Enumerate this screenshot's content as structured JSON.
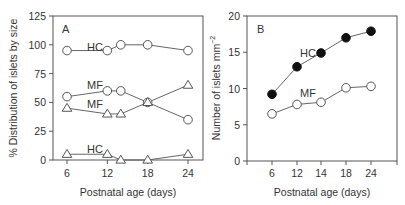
{
  "chart_data": [
    {
      "panel": "A",
      "type": "line",
      "title": "",
      "panel_label": "A",
      "xlabel": "Postnatal age (days)",
      "ylabel": "% Distribution of islets by size",
      "x": [
        6,
        12,
        14,
        18,
        24
      ],
      "xticks": [
        6,
        12,
        18,
        24
      ],
      "yticks": [
        0,
        25,
        50,
        75,
        100,
        125
      ],
      "ylim": [
        0,
        125
      ],
      "xlim": [
        4,
        26
      ],
      "grid": false,
      "series": [
        {
          "name": "HC",
          "group": "circle",
          "marker": "open-circle",
          "values": [
            95,
            95,
            100,
            100,
            95
          ],
          "label_pos": {
            "x": 12,
            "y": 100
          }
        },
        {
          "name": "MF",
          "group": "circle",
          "marker": "open-circle",
          "values": [
            55,
            60,
            60,
            50,
            35
          ],
          "label_pos": {
            "x": 10.5,
            "y": 63
          }
        },
        {
          "name": "MF",
          "group": "triangle",
          "marker": "open-triangle",
          "values": [
            45,
            40,
            40,
            50,
            65
          ],
          "label_pos": {
            "x": 10.5,
            "y": 49
          }
        },
        {
          "name": "HC",
          "group": "triangle",
          "marker": "open-triangle",
          "values": [
            5,
            5,
            0,
            0,
            5
          ],
          "label_pos": {
            "x": 10.5,
            "y": 9
          }
        }
      ]
    },
    {
      "panel": "B",
      "type": "line",
      "title": "",
      "panel_label": "B",
      "xlabel": "Postnatal age (days)",
      "ylabel": "Number of islets mm⁻²",
      "categories": [
        "6",
        "12",
        "14",
        "18",
        "24"
      ],
      "yticks": [
        0,
        5,
        10,
        15,
        20
      ],
      "ylim": [
        0,
        20
      ],
      "grid": false,
      "series": [
        {
          "name": "HC",
          "marker": "filled-circle",
          "values": [
            9.2,
            13.0,
            14.9,
            17.0,
            17.9
          ]
        },
        {
          "name": "MF",
          "marker": "open-circle",
          "values": [
            6.5,
            7.8,
            8.1,
            10.1,
            10.3
          ]
        }
      ]
    }
  ],
  "panels": {
    "a": {
      "label": "A",
      "ylabel": "% Distribution of islets by size",
      "xlabel": "Postnatal age (days)",
      "series_labels": {
        "hc_top": "HC",
        "mf_circle": "MF",
        "mf_triangle": "MF",
        "hc_bottom": "HC"
      }
    },
    "b": {
      "label": "B",
      "ylabel_main": "Number of islets mm",
      "ylabel_sup": "−2",
      "xlabel": "Postnatal age (days)",
      "series_labels": {
        "hc": "HC",
        "mf": "MF"
      }
    }
  }
}
